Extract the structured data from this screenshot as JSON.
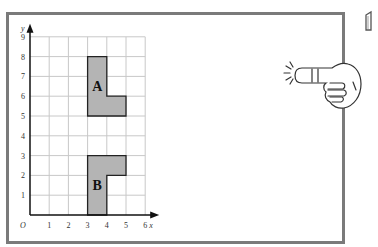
{
  "diagram": {
    "axes": {
      "x_label": "x",
      "y_label": "y",
      "origin_label": "O",
      "x_ticks": [
        "1",
        "2",
        "3",
        "4",
        "5",
        "6"
      ],
      "y_ticks": [
        "1",
        "2",
        "3",
        "4",
        "5",
        "6",
        "7",
        "8",
        "9"
      ],
      "x_range": [
        0,
        6
      ],
      "y_range": [
        0,
        9
      ]
    },
    "shapes": [
      {
        "label": "A",
        "vertices": [
          [
            3,
            8
          ],
          [
            4,
            8
          ],
          [
            4,
            6
          ],
          [
            5,
            6
          ],
          [
            5,
            5
          ],
          [
            3,
            5
          ]
        ],
        "fill": "#b4b4b4"
      },
      {
        "label": "B",
        "vertices": [
          [
            3,
            0
          ],
          [
            4,
            0
          ],
          [
            4,
            2
          ],
          [
            5,
            2
          ],
          [
            5,
            3
          ],
          [
            3,
            3
          ]
        ],
        "fill": "#b4b4b4"
      }
    ],
    "grid_color": "#c8c8c8",
    "frame_color": "#7a7a7a"
  },
  "decorations": {
    "pointing_hand": "pointing-hand-icon",
    "corner_icon": "page-curl-icon"
  }
}
